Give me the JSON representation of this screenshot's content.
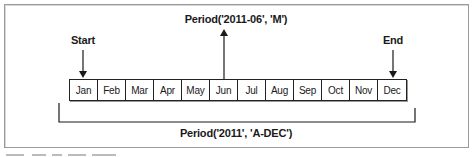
{
  "diagram": {
    "start_label": "Start",
    "end_label": "End",
    "month_period_label": "Period('2011-06', 'M')",
    "annual_period_label": "Period('2011', 'A-DEC')",
    "months": [
      "Jan",
      "Feb",
      "Mar",
      "Apr",
      "May",
      "Jun",
      "Jul",
      "Aug",
      "Sep",
      "Oct",
      "Nov",
      "Dec"
    ],
    "highlighted_month": "Jun",
    "start_month": "Jan",
    "end_month": "Dec",
    "colors": {
      "line": "#1a1a1a",
      "frame": "#9a9a9a",
      "background": "#ffffff"
    }
  }
}
